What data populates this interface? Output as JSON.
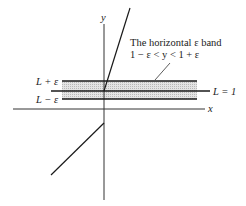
{
  "diagram": {
    "axes": {
      "x_label": "x",
      "y_label": "y"
    },
    "band": {
      "annotation_line1": "The horizontal ε band",
      "annotation_line2": "1 − ε < y < 1 + ε",
      "fill_color": "#d4d4d4"
    },
    "labels": {
      "upper": "L + ε",
      "lower": "L − ε",
      "limit": "L = 1"
    },
    "colors": {
      "line": "#1a1a1a",
      "axis": "#333333"
    }
  }
}
